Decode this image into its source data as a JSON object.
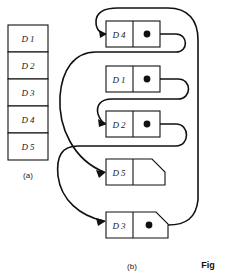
{
  "figure": {
    "label_a": "(a)",
    "label_b": "(b)",
    "caption_partial": "Fig"
  },
  "panel_a": {
    "name": "array-column",
    "cells": [
      {
        "label": "D 1"
      },
      {
        "label": "D 2"
      },
      {
        "label": "D 3"
      },
      {
        "label": "D 4"
      },
      {
        "label": "D 5"
      }
    ]
  },
  "panel_b": {
    "name": "linked-list",
    "nodes": [
      {
        "id": "n1",
        "label": "D 4",
        "has_pointer": true,
        "null_node": false
      },
      {
        "id": "n2",
        "label": "D 1",
        "has_pointer": true,
        "null_node": false
      },
      {
        "id": "n3",
        "label": "D 2",
        "has_pointer": true,
        "null_node": false
      },
      {
        "id": "n4",
        "label": "D 5",
        "has_pointer": false,
        "null_node": true
      },
      {
        "id": "n5",
        "label": "D 3",
        "has_pointer": true,
        "null_node": false
      }
    ],
    "edges": [
      {
        "from": "D 4",
        "to": "D 5"
      },
      {
        "from": "D 1",
        "to": "D 2"
      },
      {
        "from": "D 2",
        "to": "D 3"
      },
      {
        "from": "D 3",
        "to": "D 4"
      }
    ]
  },
  "colors": {
    "ink": "#111111",
    "paper": "#ffffff"
  }
}
